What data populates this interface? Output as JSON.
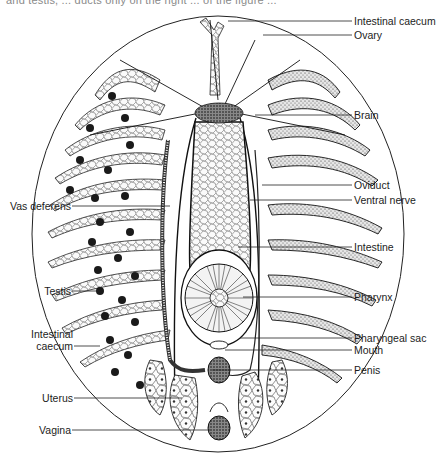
{
  "caption": "and testis, ... ducts only on the right ... of the figure ...",
  "figure": {
    "colors": {
      "ink": "#1c1c1c",
      "background": "#ffffff",
      "cell_fill": "#f4f4f4",
      "dark_tissue": "#2a2a2a"
    },
    "labels_right": [
      {
        "id": "intestinal-caecum-top",
        "text": "Intestinal caecum",
        "y": 21,
        "x_from": 228
      },
      {
        "id": "ovary",
        "text": "Ovary",
        "y": 35,
        "x_from": 263
      },
      {
        "id": "brain",
        "text": "Brain",
        "y": 115,
        "x_from": 255
      },
      {
        "id": "oviduct",
        "text": "Oviduct",
        "y": 185,
        "x_from": 262
      },
      {
        "id": "ventral-nerve",
        "text": "Ventral nerve",
        "y": 200,
        "x_from": 250
      },
      {
        "id": "intestine",
        "text": "Intestine",
        "y": 247,
        "x_from": 238
      },
      {
        "id": "pharynx",
        "text": "Pharynx",
        "y": 297,
        "x_from": 243
      },
      {
        "id": "pharyngeal-sac",
        "text": "Pharyngeal sac",
        "y": 338,
        "x_from": 240
      },
      {
        "id": "mouth",
        "text": "Mouth",
        "y": 350,
        "x_from": 225
      },
      {
        "id": "penis",
        "text": "Penis",
        "y": 370,
        "x_from": 212
      }
    ],
    "labels_left": [
      {
        "id": "vas-deferens",
        "text": "Vas deferens",
        "y": 206,
        "x_to": 170
      },
      {
        "id": "testis",
        "text": "Testis",
        "y": 291,
        "x_to": 100
      },
      {
        "id": "intestinal-caecum-left",
        "line1": "Intestinal",
        "line2": "caecum",
        "y": 346,
        "x_to": 100
      },
      {
        "id": "uterus",
        "text": "Uterus",
        "y": 398,
        "x_to": 182
      },
      {
        "id": "vagina",
        "text": "Vagina",
        "y": 430,
        "x_to": 210
      }
    ]
  }
}
